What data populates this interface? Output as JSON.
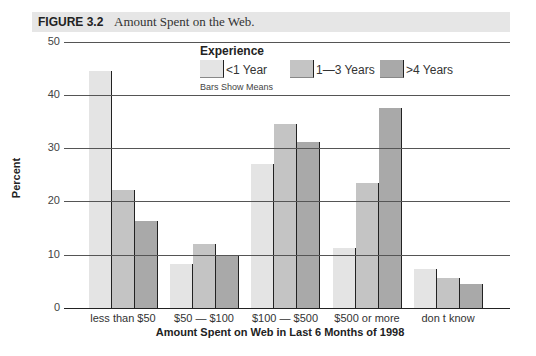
{
  "figure": {
    "label": "FIGURE 3.2",
    "caption": "Amount Spent on the Web."
  },
  "legend": {
    "title": "Experience",
    "note": "Bars Show Means",
    "items": [
      {
        "label": "<1 Year",
        "color": "#e4e4e4"
      },
      {
        "label": "1—3 Years",
        "color": "#c4c4c4"
      },
      {
        "label": ">4 Years",
        "color": "#a9a9a9"
      }
    ]
  },
  "axes": {
    "ylabel": "Percent",
    "xlabel": "Amount Spent on Web in Last 6 Months of 1998",
    "yticks": [
      "0",
      "10",
      "20",
      "30",
      "40",
      "50"
    ]
  },
  "chart_data": {
    "type": "bar",
    "title": "Amount Spent on the Web.",
    "xlabel": "Amount Spent on Web in Last 6 Months of 1998",
    "ylabel": "Percent",
    "ylim": [
      0,
      50
    ],
    "yticks": [
      0,
      10,
      20,
      30,
      40,
      50
    ],
    "grid": true,
    "legend_title": "Experience",
    "legend_position": "top-right inside",
    "annotation": "Bars Show Means",
    "categories": [
      "less than $50",
      "$50 — $100",
      "$100 — $500",
      "$500 or more",
      "don t know"
    ],
    "series": [
      {
        "name": "<1 Year",
        "values": [
          44.5,
          8.2,
          27.1,
          11.2,
          7.3
        ]
      },
      {
        "name": "1—3 Years",
        "values": [
          22.2,
          12.1,
          34.6,
          23.4,
          5.6
        ]
      },
      {
        "name": ">4 Years",
        "values": [
          16.4,
          10.0,
          31.2,
          37.6,
          4.5
        ]
      }
    ]
  }
}
